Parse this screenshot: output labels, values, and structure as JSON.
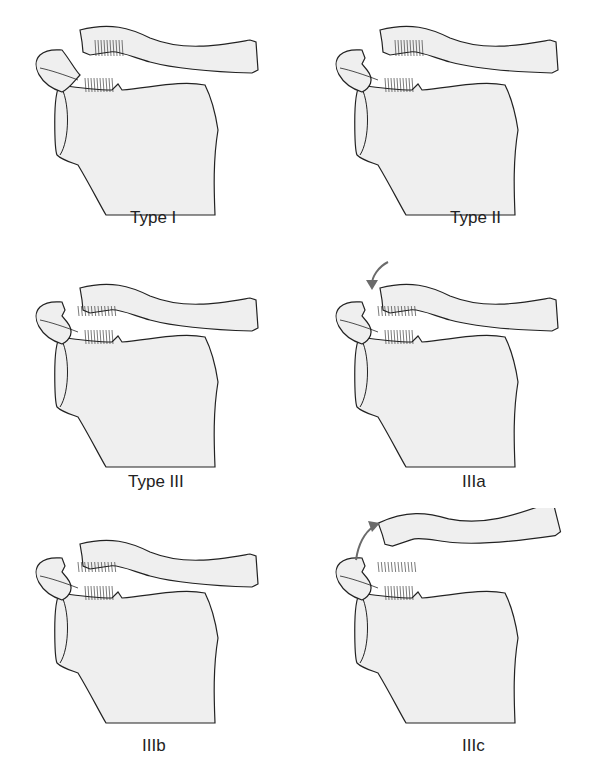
{
  "figure": {
    "type": "anatomical-illustration",
    "colors": {
      "bone_fill": "#efefef",
      "outline": "#222222",
      "arrow": "#6b6b6b",
      "background": "#ffffff"
    },
    "panels": [
      {
        "id": "type-1",
        "label": "Type I",
        "clavicle": "attached",
        "ligaments": "stretched",
        "arrow": "none"
      },
      {
        "id": "type-2",
        "label": "Type II",
        "clavicle": "partially separated",
        "ligaments": "AC torn, CC intact",
        "arrow": "none"
      },
      {
        "id": "type-3",
        "label": "Type III",
        "clavicle": "separated",
        "ligaments": "AC and CC torn",
        "arrow": "none"
      },
      {
        "id": "type-3a",
        "label": "IIIa",
        "clavicle": "separated",
        "ligaments": "AC and CC torn",
        "arrow": "downward"
      },
      {
        "id": "type-3b",
        "label": "IIIb",
        "clavicle": "separated",
        "ligaments": "AC and CC torn",
        "arrow": "none"
      },
      {
        "id": "type-3c",
        "label": "IIIc",
        "clavicle": "elevated",
        "ligaments": "AC and CC torn",
        "arrow": "upward"
      }
    ]
  }
}
